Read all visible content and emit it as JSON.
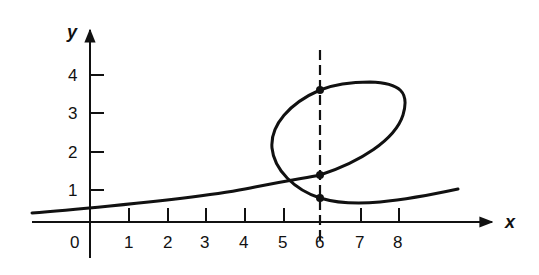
{
  "diagram": {
    "type": "parametric-curve-with-vertical-line-test",
    "axes": {
      "x_label": "x",
      "y_label": "y",
      "x_ticks": [
        "0",
        "1",
        "2",
        "3",
        "4",
        "5",
        "6",
        "7",
        "8"
      ],
      "y_ticks": [
        "1",
        "2",
        "3",
        "4"
      ]
    },
    "vertical_line": {
      "x": 6,
      "style": "dashed"
    },
    "intersection_points": [
      {
        "x": 6,
        "y": 3.6
      },
      {
        "x": 6,
        "y": 1.4
      },
      {
        "x": 6,
        "y": 0.8
      }
    ],
    "curve_description": "Smooth curve rising slowly from left, looping counter-clockwise between x≈4.8 and x≈8.2, then continuing right; crosses the dashed line x=6 three times",
    "colors": {
      "ink": "#111111",
      "background": "#ffffff"
    }
  }
}
